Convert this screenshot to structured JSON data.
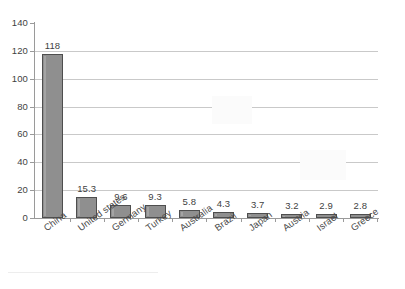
{
  "chart_data": {
    "type": "bar",
    "title": "",
    "subtitle": "",
    "xlabel": "",
    "ylabel": "",
    "categories": [
      "China",
      "United states",
      "Germany",
      "Turkey",
      "Australia",
      "Brazil",
      "Japan",
      "Austria",
      "Israel",
      "Greece"
    ],
    "values": [
      118,
      15.3,
      9.6,
      9.3,
      5.8,
      4.3,
      3.7,
      3.2,
      2.9,
      2.8
    ],
    "value_labels": [
      "118",
      "15.3",
      "9.6",
      "9.3",
      "5.8",
      "4.3",
      "3.7",
      "3.2",
      "2.9",
      "2.8"
    ],
    "ylim": [
      0,
      140
    ],
    "ytick_values": [
      0,
      20,
      40,
      60,
      80,
      100,
      120,
      140
    ],
    "ytick_labels": [
      "0",
      "20",
      "40",
      "60",
      "80",
      "100",
      "120",
      "140"
    ],
    "gridline_values": [
      20,
      40,
      60,
      80,
      100,
      120
    ],
    "grid": true,
    "legend": false,
    "legend_position": "none",
    "data_labels": true,
    "xtick_label_rotation": -36,
    "colors": {
      "bar_fill": "#8f8f8f",
      "bar_border": "#4e4e4e",
      "gridline": "#c9c9c9",
      "axis": "#9a9a9a",
      "text": "#3f3f3f",
      "background": "#ffffff"
    }
  }
}
